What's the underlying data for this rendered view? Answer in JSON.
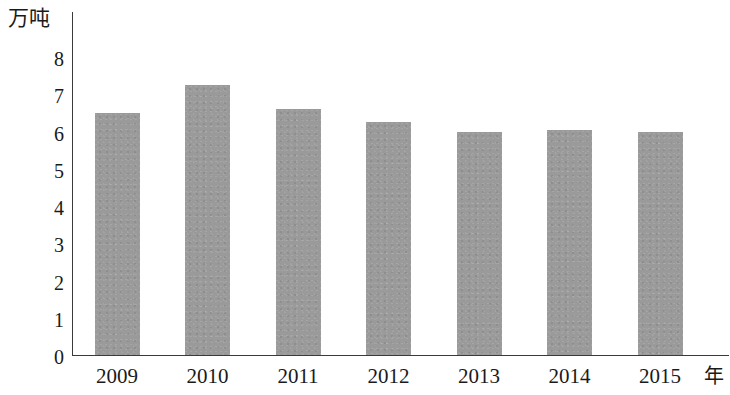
{
  "chart_data": {
    "type": "bar",
    "title": "",
    "subtitle": "",
    "xlabel": "年",
    "ylabel": "万吨",
    "categories": [
      "2009",
      "2010",
      "2011",
      "2012",
      "2013",
      "2014",
      "2015"
    ],
    "values": [
      6.5,
      7.25,
      6.6,
      6.25,
      6.0,
      6.05,
      6.0
    ],
    "series": [
      {
        "name": "",
        "values": [
          6.5,
          7.25,
          6.6,
          6.25,
          6.0,
          6.05,
          6.0
        ]
      }
    ],
    "ylim": [
      0,
      8
    ],
    "y_ticks": [
      "8",
      "7",
      "6",
      "5",
      "4",
      "3",
      "2",
      "1",
      "0"
    ],
    "y_tick_values": [
      8,
      7,
      6,
      5,
      4,
      3,
      2,
      1,
      0
    ],
    "grid": false,
    "legend": null,
    "legend_position": "none",
    "bar_color": "#9a9a9a",
    "axis_color": "#3a3a3a",
    "background_color": "#ffffff"
  },
  "axes": {
    "y_unit_caption": "万吨",
    "x_unit_caption": "年"
  }
}
